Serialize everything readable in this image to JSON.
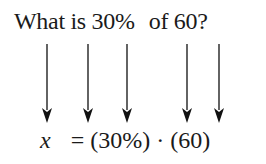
{
  "question": {
    "part1": "What is 30%",
    "part2": "of 60?"
  },
  "arrows": [
    47,
    88,
    127,
    187,
    219
  ],
  "equation": {
    "variable": "x",
    "rest": "= (30%) · (60)"
  }
}
